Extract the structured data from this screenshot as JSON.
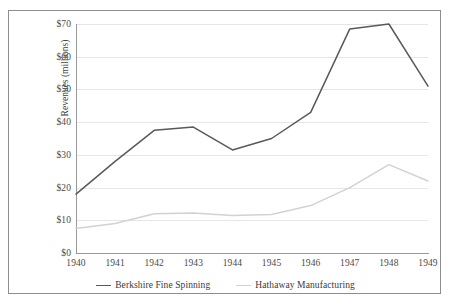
{
  "chart_data": {
    "type": "line",
    "title": "",
    "xlabel": "",
    "ylabel": "Revenues (millions)",
    "categories": [
      "1940",
      "1941",
      "1942",
      "1943",
      "1944",
      "1945",
      "1946",
      "1947",
      "1948",
      "1949"
    ],
    "ylim": [
      0,
      70
    ],
    "ytick_step": 10,
    "ytick_labels": [
      "$70",
      "$60",
      "$50",
      "$40",
      "$30",
      "$20",
      "$10",
      "$0"
    ],
    "ytick_values": [
      70,
      60,
      50,
      40,
      30,
      20,
      10,
      0
    ],
    "grid": "horizontal",
    "legend_position": "bottom-center",
    "series": [
      {
        "name": "Berkshire Fine Spinning",
        "color": "#595959",
        "values": [
          18.0,
          28.0,
          37.5,
          38.5,
          31.5,
          35.0,
          43.0,
          68.5,
          70.0,
          51.0
        ]
      },
      {
        "name": "Hathaway Manufacturing",
        "color": "#d2d2d2",
        "values": [
          7.5,
          9.0,
          12.0,
          12.2,
          11.5,
          11.8,
          14.5,
          20.0,
          27.0,
          22.0
        ]
      }
    ]
  },
  "axis": {
    "y_title": "Revenues (millions)"
  }
}
